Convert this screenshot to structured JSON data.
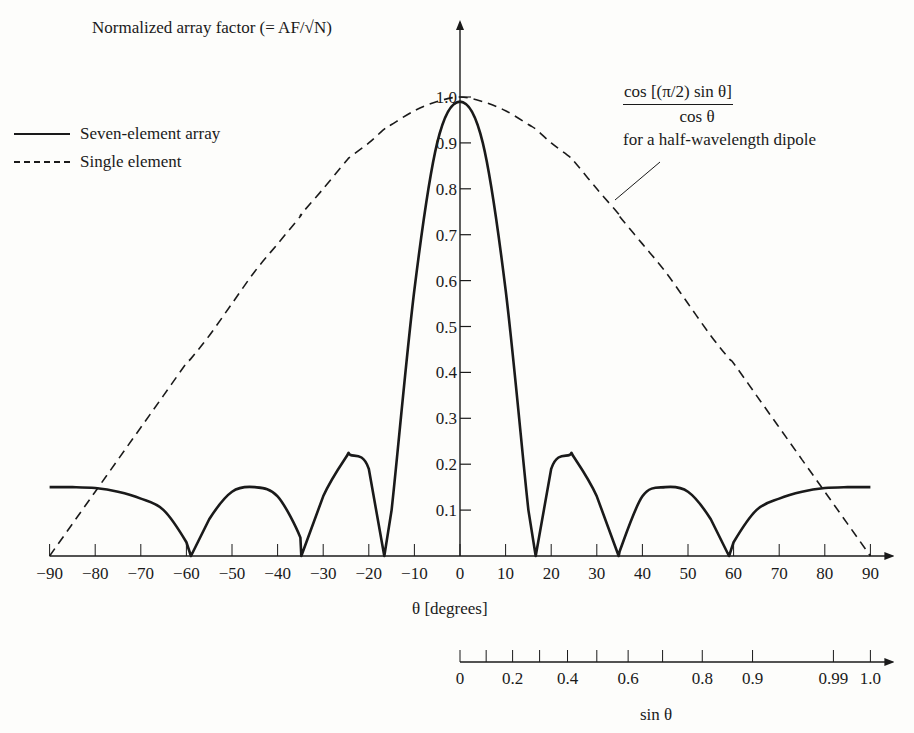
{
  "chart_data": {
    "type": "line",
    "title": "",
    "ylabel": "Normalized array factor (= AF/√N)",
    "xlabel": "θ [degrees]",
    "secondary_xlabel": "sin θ",
    "xlim": [
      -90,
      90
    ],
    "ylim": [
      0,
      1.0
    ],
    "grid": false,
    "legend_position": "upper-left",
    "x_ticks": [
      -90,
      -80,
      -70,
      -60,
      -50,
      -40,
      -30,
      -20,
      -10,
      0,
      10,
      20,
      30,
      40,
      50,
      60,
      70,
      80,
      90
    ],
    "x_tick_labels": [
      "−90",
      "−80",
      "−70",
      "−60",
      "−50",
      "−40",
      "−30",
      "−20",
      "−10",
      "0",
      "10",
      "20",
      "30",
      "40",
      "50",
      "60",
      "70",
      "80",
      "90"
    ],
    "y_ticks": [
      0.1,
      0.2,
      0.3,
      0.4,
      0.5,
      0.6,
      0.7,
      0.8,
      0.9,
      1.0
    ],
    "y_tick_labels": [
      "0.1",
      "0.2",
      "0.3",
      "0.4",
      "0.5",
      "0.6",
      "0.7",
      "0.8",
      "0.9",
      "1.0"
    ],
    "secondary_axis": {
      "label": "sin θ",
      "ticks": [
        0,
        0.1,
        0.2,
        0.3,
        0.4,
        0.5,
        0.6,
        0.7,
        0.8,
        0.9,
        0.99,
        1.0
      ],
      "tick_labels": {
        "0": "0",
        "0.2": "0.2",
        "0.4": "0.4",
        "0.6": "0.6",
        "0.8": "0.8",
        "0.9": "0.9",
        "0.99": "0.99",
        "1.0": "1.0"
      }
    },
    "x": [
      -90,
      -85,
      -80,
      -75,
      -70,
      -65,
      -60,
      -59,
      -55,
      -50,
      -45,
      -40,
      -35,
      -34.8,
      -30,
      -25,
      -24,
      -20,
      -16.6,
      -15,
      -10,
      -5,
      0,
      5,
      10,
      15,
      16.6,
      20,
      24,
      25,
      30,
      34.8,
      35,
      40,
      45,
      50,
      55,
      59,
      60,
      65,
      70,
      75,
      80,
      85,
      90
    ],
    "series": [
      {
        "name": "Seven-element array",
        "style": "solid",
        "values": [
          0.15,
          0.15,
          0.148,
          0.14,
          0.125,
          0.1,
          0.03,
          0.0,
          0.08,
          0.14,
          0.15,
          0.13,
          0.04,
          0.0,
          0.13,
          0.215,
          0.22,
          0.19,
          0.0,
          0.1,
          0.58,
          0.9,
          0.99,
          0.9,
          0.58,
          0.1,
          0.0,
          0.19,
          0.22,
          0.215,
          0.13,
          0.0,
          0.01,
          0.13,
          0.15,
          0.14,
          0.08,
          0.0,
          0.03,
          0.1,
          0.125,
          0.14,
          0.148,
          0.15,
          0.15
        ]
      },
      {
        "name": "Single element",
        "style": "dashed",
        "formula": "cos[(π/2) sin θ] / cos θ",
        "values": [
          0.0,
          0.07,
          0.14,
          0.21,
          0.28,
          0.35,
          0.42,
          0.43,
          0.48,
          0.55,
          0.62,
          0.68,
          0.74,
          0.745,
          0.8,
          0.86,
          0.87,
          0.9,
          0.93,
          0.94,
          0.97,
          0.99,
          1.0,
          0.99,
          0.97,
          0.94,
          0.93,
          0.9,
          0.87,
          0.86,
          0.8,
          0.745,
          0.74,
          0.68,
          0.62,
          0.55,
          0.48,
          0.43,
          0.42,
          0.35,
          0.28,
          0.21,
          0.14,
          0.07,
          0.0
        ]
      }
    ],
    "nulls_deg": [
      -59,
      -34.8,
      -16.6,
      16.6,
      34.8,
      59
    ],
    "sidelobe_peaks": [
      {
        "x": -24,
        "y": 0.22
      },
      {
        "x": -45,
        "y": 0.15
      },
      {
        "x": -90,
        "y": 0.15
      },
      {
        "x": 24,
        "y": 0.22
      },
      {
        "x": 45,
        "y": 0.15
      },
      {
        "x": 90,
        "y": 0.15
      }
    ],
    "annotations": [
      {
        "text": "cos [(π/2) sin θ] / cos θ for a half-wavelength dipole",
        "points_to": "Single element curve at θ ≈ 37°"
      }
    ]
  },
  "labels": {
    "ylabel": "Normalized array factor (= AF/√N)",
    "xlabel": "θ [degrees]",
    "sin_label": "sin θ",
    "legend": [
      {
        "label": "Seven-element array",
        "style": "solid"
      },
      {
        "label": "Single element",
        "style": "dashed"
      }
    ],
    "formula_numerator": "cos [(π/2) sin θ]",
    "formula_denominator": "cos θ",
    "formula_note": "for a half-wavelength dipole"
  },
  "colors": {
    "ink": "#1a1a1a",
    "background": "#fdfdfb"
  }
}
